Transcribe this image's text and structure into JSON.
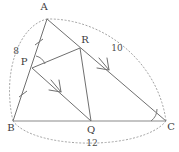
{
  "figure": {
    "kind": "geometry-diagram",
    "background": "#ffffff",
    "stroke_color": "#6b6b6b",
    "dotted_color": "#9a9a9a",
    "text_color": "#3b3b3b"
  },
  "vertices": [
    {
      "id": "A",
      "label": "A",
      "x": 47,
      "y": 19,
      "label_x": 44,
      "label_y": 7
    },
    {
      "id": "B",
      "label": "B",
      "x": 13,
      "y": 121,
      "label_x": 11,
      "label_y": 128
    },
    {
      "id": "C",
      "label": "C",
      "x": 166,
      "y": 121,
      "label_x": 171,
      "label_y": 127
    },
    {
      "id": "P",
      "label": "P",
      "x": 32,
      "y": 68,
      "label_x": 24,
      "label_y": 62
    },
    {
      "id": "Q",
      "label": "Q",
      "x": 91,
      "y": 121,
      "label_x": 91,
      "label_y": 130
    },
    {
      "id": "R",
      "label": "R",
      "x": 80,
      "y": 48,
      "label_x": 85,
      "label_y": 40
    }
  ],
  "segments": [
    {
      "name": "side-AB",
      "from": "A",
      "to": "B"
    },
    {
      "name": "side-BC",
      "from": "B",
      "to": "C"
    },
    {
      "name": "side-AC",
      "from": "A",
      "to": "C"
    },
    {
      "name": "segment-PR",
      "from": "P",
      "to": "R"
    },
    {
      "name": "segment-PQ",
      "from": "P",
      "to": "Q"
    },
    {
      "name": "segment-RQ",
      "from": "R",
      "to": "Q"
    }
  ],
  "measurements": [
    {
      "name": "length-AB",
      "value": "8",
      "x": 16,
      "y": 51,
      "side": "AB"
    },
    {
      "name": "length-AC",
      "value": "10",
      "x": 117,
      "y": 48,
      "side": "AC"
    },
    {
      "name": "length-BC",
      "value": "12",
      "x": 92,
      "y": 143,
      "side": "BC"
    }
  ],
  "tick_marks": [
    {
      "name": "tick-AP",
      "x": 39,
      "y": 42,
      "angle": -72
    },
    {
      "name": "tick-PB",
      "x": 23,
      "y": 94,
      "angle": -72
    }
  ],
  "arrow_marks": [
    {
      "name": "arrow-PQ",
      "x": 58,
      "y": 89,
      "angle": 42
    },
    {
      "name": "arrow-RC",
      "x": 106,
      "y": 66,
      "angle": 40
    }
  ],
  "angle_arcs": [
    {
      "name": "angle-at-P",
      "vertex": "P",
      "radius": 13
    },
    {
      "name": "angle-at-C",
      "vertex": "C",
      "radius": 15
    }
  ],
  "dotted_arcs": [
    {
      "name": "arc-AB-measure",
      "from": "A",
      "to": "B",
      "bulge": "left"
    },
    {
      "name": "arc-AC-measure",
      "from": "A",
      "to": "C",
      "bulge": "right"
    },
    {
      "name": "arc-BC-measure",
      "from": "B",
      "to": "C",
      "bulge": "down"
    }
  ]
}
